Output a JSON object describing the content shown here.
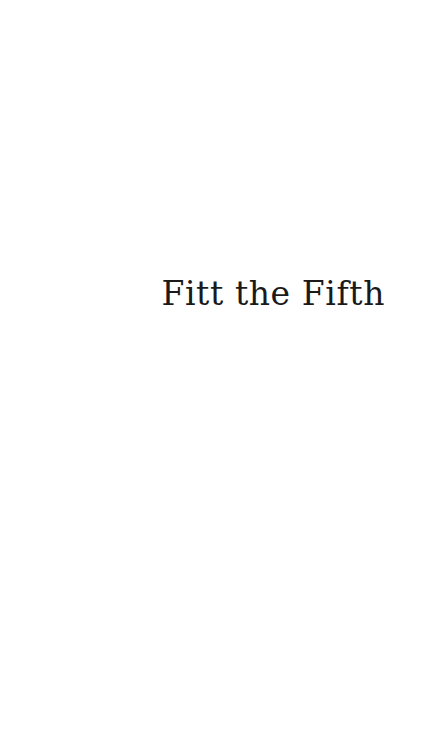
{
  "page": {
    "background_color": "#ffffff",
    "text_color": "#1a1a1a",
    "chapter_title": "Fitt the Fifth"
  }
}
